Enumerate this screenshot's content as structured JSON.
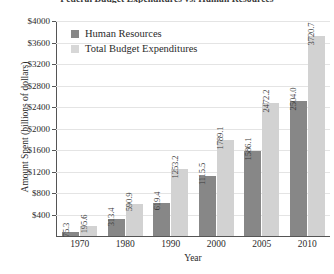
{
  "chart_data": {
    "type": "bar",
    "title": "Federal Budget Expenditures vs. Human Resources",
    "xlabel": "Year",
    "ylabel": "Amount Spent (billions of dollars)",
    "categories": [
      "1970",
      "1980",
      "1990",
      "2000",
      "2005",
      "2010"
    ],
    "series": [
      {
        "name": "Human Resources",
        "color": "#878787",
        "values": [
          75.3,
          313.4,
          619.4,
          1115.5,
          1586.1,
          2504.0
        ],
        "labels": [
          "75.3",
          "313.4",
          "619.4",
          "1115.5",
          "1586.1",
          "2504.0"
        ]
      },
      {
        "name": "Total Budget Expenditures",
        "color": "#d2d2d2",
        "values": [
          195.6,
          590.9,
          1253.2,
          1789.1,
          2472.2,
          3720.7
        ],
        "labels": [
          "195.6",
          "590.9",
          "1253.2",
          "1789.1",
          "2472.2",
          "3720.7"
        ]
      }
    ],
    "ylim": [
      0,
      4000
    ],
    "ytick_values": [
      400,
      800,
      1200,
      1600,
      2000,
      2400,
      2800,
      3200,
      3600,
      4000
    ],
    "ytick_labels": [
      "$400",
      "$800",
      "$1200",
      "$1600",
      "$2000",
      "$2400",
      "$2800",
      "$3200",
      "$3600",
      "$4000"
    ],
    "grid": true,
    "legend_position": "top-left"
  }
}
